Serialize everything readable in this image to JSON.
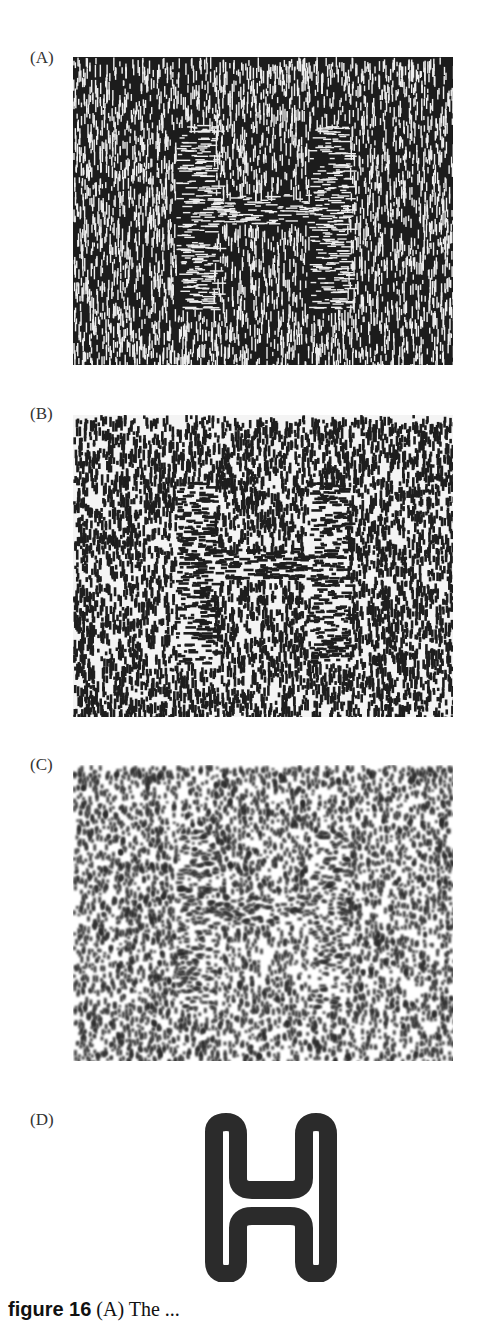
{
  "figure": {
    "panels": [
      {
        "label": "(A)",
        "texture": "vertical line segments; H region horizontal segments",
        "background": "#1c1c1c",
        "foreground": "#f2f2f2"
      },
      {
        "label": "(B)",
        "texture": "blurred vertical blobs; H region horizontal blobs",
        "background": "#ffffff",
        "foreground": "#1e1e1e"
      },
      {
        "label": "(C)",
        "texture": "further blurred speckle; faint H",
        "background": "#ffffff",
        "foreground": "#2a2a2a"
      },
      {
        "label": "(D)",
        "texture": "outlined letter H",
        "background": "#ffffff",
        "foreground": "#2b2b2b"
      }
    ],
    "caption": {
      "bold": "figure 16",
      "text": " (A) The ..."
    }
  }
}
